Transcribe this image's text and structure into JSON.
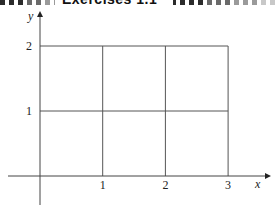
{
  "header": {
    "title": "Exercises 1.1",
    "stripe_colors": [
      "#2b2b2b",
      "#6a6a6a",
      "#9a9a9a",
      "#c8c8c8"
    ]
  },
  "diagram": {
    "type": "coordinate-grid",
    "x_axis_label": "x",
    "y_axis_label": "y",
    "x_ticks": [
      "1",
      "2",
      "3"
    ],
    "y_ticks": [
      "1",
      "2"
    ],
    "x_range": [
      0,
      3
    ],
    "y_range": [
      0,
      2
    ],
    "grid_lines_x": [
      1,
      2,
      3
    ],
    "grid_lines_y": [
      1,
      2
    ],
    "line_color": "#555555"
  }
}
